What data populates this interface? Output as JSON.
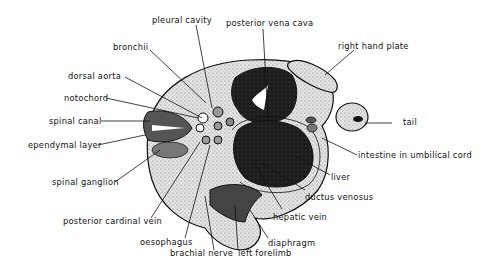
{
  "figure": {
    "type": "anatomical cross-section",
    "labels": {
      "pleural_cavity": "pleural cavity",
      "posterior_vena_cava": "posterior vena cava",
      "bronchii": "bronchii",
      "right_hand_plate": "right hand plate",
      "dorsal_aorta": "dorsal aorta",
      "notochord": "notochord",
      "spinal_canal": "spinal canal",
      "tail": "tail",
      "ependymal_layer": "ependymal layer",
      "intestine_in_umbilical_cord": "intestine in umbilical cord",
      "liver": "liver",
      "spinal_ganglion": "spinal ganglion",
      "ductus_venosus": "ductus venosus",
      "hepatic_vein": "hepatic vein",
      "posterior_cardinal_vein": "posterior cardinal vein",
      "diaphragm": "diaphragm",
      "oesophagus": "oesophagus",
      "brachial_nerve": "brachial nerve",
      "left_forelimb": "left forelimb"
    },
    "colors": {
      "ink": "#111111",
      "tissue_light": "#d9d9d9",
      "tissue_mid": "#8c8c8c",
      "tissue_dark": "#1a1a1a",
      "background": "#ffffff"
    }
  }
}
